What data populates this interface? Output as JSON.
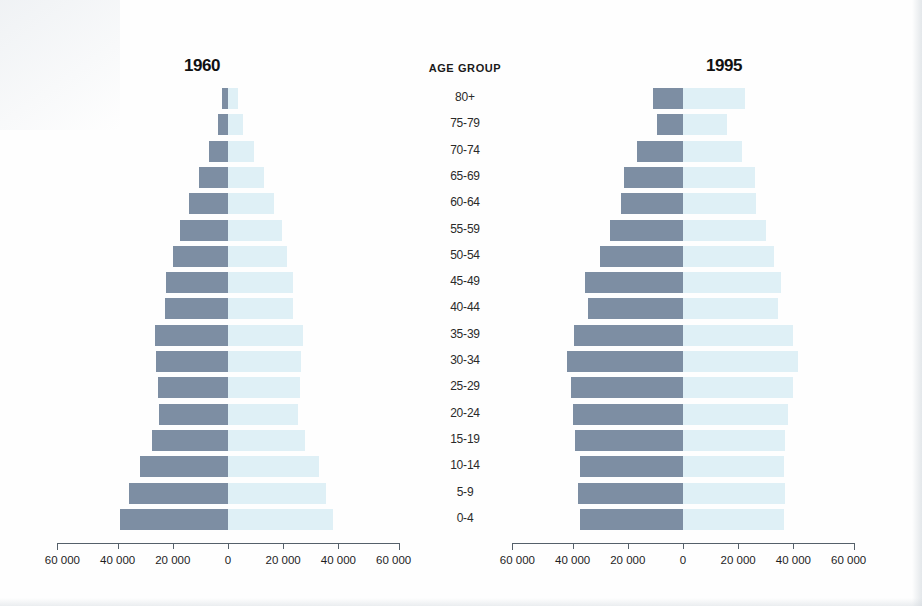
{
  "chart_data": {
    "type": "bar",
    "chart_style": "population-pyramid",
    "title": "",
    "xlabel": "",
    "ylabel": "AGE GROUP",
    "xlim": [
      -60000,
      60000
    ],
    "xticks": [
      -60000,
      -40000,
      -20000,
      0,
      20000,
      40000,
      60000
    ],
    "xticklabels": [
      "60 000",
      "40 000",
      "20 000",
      "0",
      "20 000",
      "40 000",
      "60 000"
    ],
    "grid": false,
    "legend": "none",
    "categories": [
      "80+",
      "75-79",
      "70-74",
      "65-69",
      "60-64",
      "55-59",
      "50-54",
      "45-49",
      "40-44",
      "35-39",
      "30-34",
      "25-29",
      "20-24",
      "15-19",
      "10-14",
      "5-9",
      "0-4"
    ],
    "panels": [
      {
        "name": "1960",
        "label": "1960",
        "series": [
          {
            "name": "left",
            "side": "left",
            "color": "#7d8ea3",
            "values": [
              2000,
              3500,
              7000,
              10500,
              14000,
              17500,
              20000,
              22500,
              23000,
              26500,
              26000,
              25500,
              25000,
              27500,
              32000,
              36000,
              39000
            ]
          },
          {
            "name": "right",
            "side": "right",
            "color": "#dff0f6",
            "values": [
              3500,
              5500,
              9500,
              13000,
              16500,
              19500,
              21500,
              23500,
              23500,
              27000,
              26500,
              26000,
              25500,
              28000,
              33000,
              35500,
              38000
            ]
          }
        ]
      },
      {
        "name": "1995",
        "label": "1995",
        "series": [
          {
            "name": "left",
            "side": "left",
            "color": "#7d8ea3",
            "values": [
              11000,
              9500,
              16500,
              21500,
              22500,
              26500,
              30000,
              35500,
              34500,
              39500,
              42000,
              40500,
              40000,
              39000,
              37500,
              38000,
              37500
            ]
          },
          {
            "name": "right",
            "side": "right",
            "color": "#dff0f6",
            "values": [
              22500,
              16000,
              21500,
              26000,
              26500,
              30000,
              33000,
              35500,
              34500,
              40000,
              41500,
              40000,
              38000,
              37000,
              36500,
              37000,
              36500
            ]
          }
        ]
      }
    ]
  },
  "panel_1960": {
    "title": "1960"
  },
  "panel_1995": {
    "title": "1995"
  },
  "age_column": {
    "header": "AGE GROUP",
    "labels": [
      "80+",
      "75-79",
      "70-74",
      "65-69",
      "60-64",
      "55-59",
      "50-54",
      "45-49",
      "40-44",
      "35-39",
      "30-34",
      "25-29",
      "20-24",
      "15-19",
      "10-14",
      "5-9",
      "0-4"
    ]
  },
  "axis_left": {
    "labels": [
      "60 000",
      "40 000",
      "20 000",
      "0",
      "20 000",
      "40 000",
      "60 000"
    ]
  },
  "axis_right": {
    "labels": [
      "60 000",
      "40 000",
      "20 000",
      "0",
      "20 000",
      "40 000",
      "60 000"
    ]
  },
  "colors": {
    "bar_left": "#7d8ea3",
    "bar_right": "#dff0f6",
    "axis": "#55606a",
    "text": "#1a1a1a",
    "background": "#ffffff"
  }
}
